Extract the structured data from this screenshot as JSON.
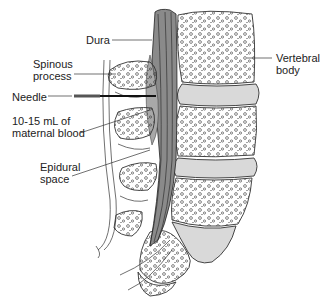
{
  "diagram": {
    "labels": {
      "dura": "Dura",
      "spinous_process_line1": "Spinous",
      "spinous_process_line2": "process",
      "needle": "Needle",
      "blood_line1": "10-15 mL of",
      "blood_line2": "maternal blood",
      "epidural_line1": "Epidural",
      "epidural_line2": "space",
      "vertebral_line1": "Vertebral",
      "vertebral_line2": "body"
    },
    "colors": {
      "ink": "#222222",
      "bone_fill": "#ffffff",
      "disc_fill": "#d9d9d9",
      "dura_fill": "#8a8a8a",
      "blood_fill": "#a8a8a8",
      "background": "#ffffff"
    }
  }
}
